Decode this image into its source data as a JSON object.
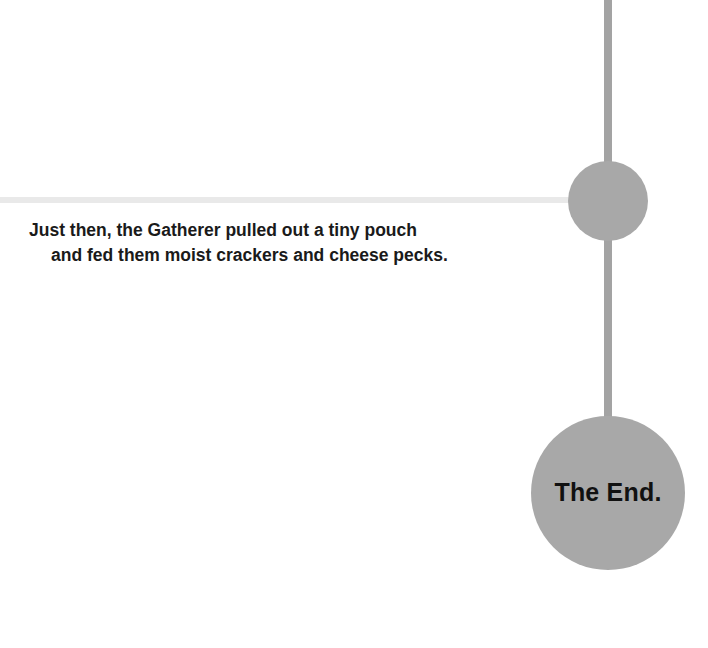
{
  "page": {
    "background_color": "#ffffff",
    "width": 708,
    "height": 648
  },
  "story": {
    "caption_line_1": "Just then, the Gatherer pulled out a tiny pouch",
    "caption_line_2": "and fed them moist crackers and cheese pecks."
  },
  "diagram": {
    "node_color": "#a8a8a8",
    "connector_color": "#a3a3a3",
    "faint_connector_color": "#e9e9e9",
    "end_node": {
      "label": "The End."
    }
  }
}
